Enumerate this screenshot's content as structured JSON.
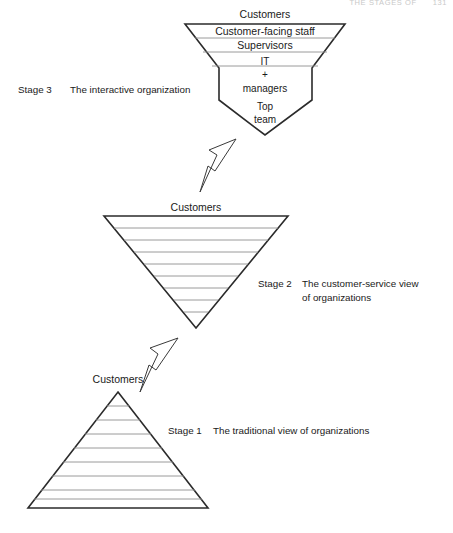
{
  "header": {
    "running_head": "THE STAGES OF",
    "page_number": "131"
  },
  "diagram": {
    "stage3": {
      "label_stage": "Stage 3",
      "label_text": "The interactive organization",
      "top_label": "Customers",
      "bands": [
        "Customer-facing staff",
        "Supervisors"
      ],
      "middle_lines": [
        "IT",
        "+",
        "managers"
      ],
      "bottom_lines": [
        "Top",
        "team"
      ]
    },
    "stage2": {
      "label_stage": "Stage 2",
      "label_line1": "The customer-service view",
      "label_line2": "of organizations",
      "top_label": "Customers",
      "internal_divider_count": 8
    },
    "stage1": {
      "label_stage": "Stage 1",
      "label_text": "The traditional view of organizations",
      "top_label": "Customers",
      "internal_divider_count": 8
    },
    "arrows": [
      {
        "name": "arrow-stage2-to-stage3"
      },
      {
        "name": "arrow-stage1-to-stage2"
      }
    ]
  },
  "colors": {
    "stroke": "#2b2b2b",
    "inner_line": "#8e8e8e",
    "background": "#ffffff",
    "header_text": "#c9c9c9"
  }
}
